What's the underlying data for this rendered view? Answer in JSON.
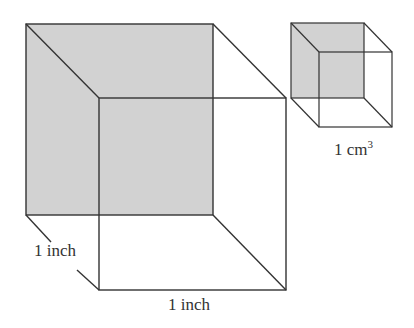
{
  "diagram": {
    "large_cube": {
      "back_face": {
        "x": 26,
        "y": 24,
        "w": 187,
        "h": 191
      },
      "front_face": {
        "x": 99,
        "y": 98,
        "w": 187,
        "h": 192
      },
      "depth_label": "1 inch",
      "width_label": "1 inch"
    },
    "small_cube": {
      "back_face": {
        "x": 291,
        "y": 23,
        "w": 73,
        "h": 75
      },
      "front_face": {
        "x": 319,
        "y": 52,
        "w": 73,
        "h": 75
      },
      "label_base": "1 cm",
      "label_exp": "3"
    },
    "colors": {
      "shade": "#d2d2d2",
      "line": "#333333"
    }
  }
}
